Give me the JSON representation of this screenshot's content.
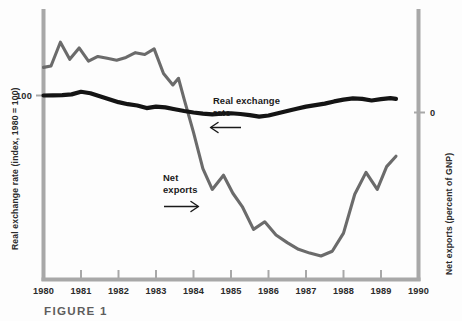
{
  "figure": {
    "caption": "FIGURE 1",
    "background_color": "#fdfdfd"
  },
  "axes": {
    "left_title": "Real exchange rate (index, 1980 = 100)",
    "left_ticks": [
      "100"
    ],
    "right_title": "Net exports (percent of GNP)",
    "right_ticks": [
      "0"
    ],
    "x_ticks": [
      "1980",
      "1981",
      "1982",
      "1983",
      "1984",
      "1985",
      "1986",
      "1987",
      "1988",
      "1989",
      "1990"
    ],
    "axis_color": "#a8a8a8"
  },
  "annotations": [
    {
      "id": "real-exchange-rate",
      "line1": "Real exchange",
      "line2": "rate",
      "arrow": "left-arrow"
    },
    {
      "id": "net-exports",
      "line1": "Net",
      "line2": "exports",
      "arrow": "right-arrow"
    }
  ],
  "chart_data": {
    "type": "line",
    "title": "FIGURE 1",
    "xlabel": "",
    "ylabel": "Real exchange rate (index, 1980 = 100)",
    "ylabel_right": "Net exports (percent of GNP)",
    "xlim": [
      1980,
      1990
    ],
    "ylim_left": [
      60,
      145
    ],
    "ylim_right": [
      -3.6,
      1.6
    ],
    "left_axis_ticks": [
      100
    ],
    "right_axis_ticks": [
      0
    ],
    "grid": false,
    "legend": "annotations-inline",
    "series": [
      {
        "name": "Real exchange rate",
        "color": "#141414",
        "axis": "left",
        "units": "index, 1980 = 100",
        "x": [
          1980.0,
          1980.25,
          1980.5,
          1980.75,
          1981.0,
          1981.25,
          1981.5,
          1981.75,
          1982.0,
          1982.25,
          1982.5,
          1982.75,
          1983.0,
          1983.25,
          1983.5,
          1983.75,
          1984.0,
          1984.25,
          1984.5,
          1984.75,
          1985.0,
          1985.25,
          1985.5,
          1985.75,
          1986.0,
          1986.25,
          1986.5,
          1986.75,
          1987.0,
          1987.25,
          1987.5,
          1987.75,
          1988.0,
          1988.25,
          1988.5,
          1988.75,
          1989.0,
          1989.25,
          1989.4
        ],
        "values": [
          100.0,
          100.1,
          100.2,
          100.6,
          102.0,
          101.2,
          99.6,
          98.0,
          96.4,
          95.3,
          94.6,
          93.2,
          94.0,
          93.6,
          92.6,
          91.6,
          90.8,
          90.2,
          89.8,
          90.2,
          90.4,
          90.0,
          89.4,
          88.6,
          89.2,
          90.4,
          91.6,
          92.8,
          94.0,
          94.8,
          95.6,
          96.8,
          97.8,
          98.4,
          98.2,
          97.3,
          98.0,
          98.6,
          98.2
        ]
      },
      {
        "name": "Net exports",
        "color": "#6b6b6b",
        "axis": "right",
        "units": "percent of GNP",
        "x": [
          1980.0,
          1980.2,
          1980.45,
          1980.7,
          1980.95,
          1981.2,
          1981.45,
          1981.7,
          1981.95,
          1982.2,
          1982.45,
          1982.7,
          1982.95,
          1983.2,
          1983.45,
          1983.6,
          1983.75,
          1984.0,
          1984.25,
          1984.5,
          1984.8,
          1985.05,
          1985.3,
          1985.6,
          1985.9,
          1986.2,
          1986.5,
          1986.8,
          1987.1,
          1987.4,
          1987.7,
          1988.0,
          1988.3,
          1988.6,
          1988.9,
          1989.15,
          1989.4
        ],
        "values": [
          0.95,
          0.98,
          1.48,
          1.12,
          1.36,
          1.08,
          1.18,
          1.14,
          1.1,
          1.16,
          1.26,
          1.22,
          1.34,
          0.82,
          0.58,
          0.72,
          0.28,
          -0.42,
          -1.18,
          -1.62,
          -1.32,
          -1.7,
          -1.98,
          -2.46,
          -2.3,
          -2.58,
          -2.74,
          -2.88,
          -2.96,
          -3.02,
          -2.92,
          -2.54,
          -1.72,
          -1.26,
          -1.62,
          -1.14,
          -0.92
        ]
      }
    ]
  }
}
